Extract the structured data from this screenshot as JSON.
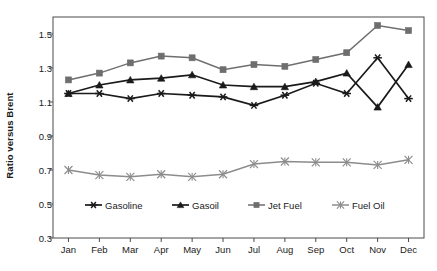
{
  "chart_data": {
    "type": "line",
    "title": "",
    "xlabel": "",
    "ylabel": "Ratio versus Brent",
    "categories": [
      "Jan",
      "Feb",
      "Mar",
      "Apr",
      "May",
      "Jun",
      "Jul",
      "Aug",
      "Sep",
      "Oct",
      "Nov",
      "Dec"
    ],
    "ylim": [
      0.3,
      1.6
    ],
    "yticks": [
      1.5,
      1.3,
      1.1,
      0.9,
      0.7,
      0.5,
      0.3
    ],
    "ytick_labels": [
      "1.5",
      "1.3",
      "1.1",
      "0.9",
      "0.7",
      "0.5",
      "0.3"
    ],
    "grid": false,
    "legend_position": "inside-bottom",
    "series": [
      {
        "name": "Gasoline",
        "marker": "star",
        "color": "#1a1a1a",
        "values": [
          1.15,
          1.15,
          1.12,
          1.15,
          1.14,
          1.13,
          1.08,
          1.14,
          1.21,
          1.15,
          1.36,
          1.12
        ]
      },
      {
        "name": "Gasoil",
        "marker": "triangle",
        "color": "#1a1a1a",
        "values": [
          1.15,
          1.2,
          1.23,
          1.24,
          1.26,
          1.2,
          1.19,
          1.19,
          1.22,
          1.27,
          1.07,
          1.32
        ]
      },
      {
        "name": "Jet Fuel",
        "marker": "square",
        "color": "#6e6e6e",
        "values": [
          1.23,
          1.27,
          1.33,
          1.37,
          1.36,
          1.29,
          1.32,
          1.31,
          1.35,
          1.39,
          1.55,
          1.52
        ]
      },
      {
        "name": "Fuel Oil",
        "marker": "cross",
        "color": "#8c8c8c",
        "values": [
          0.7,
          0.67,
          0.66,
          0.675,
          0.66,
          0.675,
          0.735,
          0.75,
          0.745,
          0.745,
          0.73,
          0.76
        ]
      }
    ]
  },
  "legend": {
    "items": [
      {
        "label": "Gasoline"
      },
      {
        "label": "Gasoil"
      },
      {
        "label": "Jet Fuel"
      },
      {
        "label": "Fuel Oil"
      }
    ]
  },
  "colors": {
    "axis": "#4a4a4a",
    "text": "#1a1a1a",
    "background": "#ffffff"
  }
}
